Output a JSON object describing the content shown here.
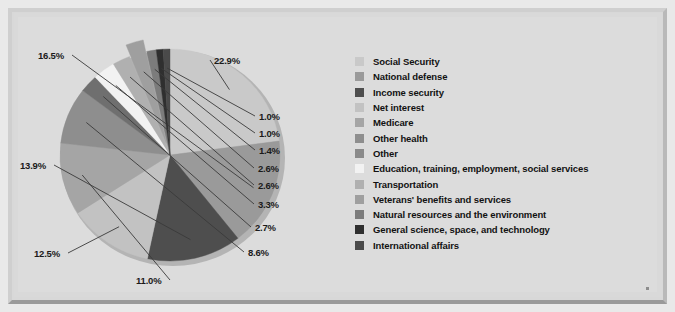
{
  "figure": {
    "background_color": "#dcdcdc",
    "frame_color": "#cfcfcf"
  },
  "chart_data": {
    "type": "pie",
    "title": "",
    "subtitle": "",
    "xlabel": "",
    "ylabel": "",
    "legend_position": "right",
    "grid": false,
    "units": "percent",
    "start_angle_deg": 0,
    "direction": "clockwise",
    "exploded_slices": [
      "Veterans' benefits and services"
    ],
    "categories": [
      "Social Security",
      "National defense",
      "Income security",
      "Net interest",
      "Medicare",
      "Other health",
      "Other",
      "Education, training, employment, social services",
      "Transportation",
      "Veterans' benefits and services",
      "Natural resources and the environment",
      "General science, space, and technology",
      "International affairs"
    ],
    "values": [
      22.9,
      16.5,
      13.9,
      12.5,
      11.0,
      8.6,
      2.7,
      3.3,
      2.6,
      2.6,
      1.4,
      1.0,
      1.0
    ],
    "value_labels": [
      "22.9%",
      "16.5%",
      "13.9%",
      "12.5%",
      "11.0%",
      "8.6%",
      "2.7%",
      "3.3%",
      "2.6%",
      "2.6%",
      "1.4%",
      "1.0%",
      "1.0%"
    ],
    "colors": [
      "#c9c9c9",
      "#9a9a9a",
      "#4e4e4e",
      "#c2c2c2",
      "#a5a5a5",
      "#8e8e8e",
      "#6f6f6f",
      "#f2f2f2",
      "#b0b0b0",
      "#9f9f9f",
      "#7c7c7c",
      "#2f2f2f",
      "#4a4a4a"
    ]
  },
  "legend": {
    "items": [
      {
        "label": "Social Security",
        "color": "#c9c9c9"
      },
      {
        "label": "National defense",
        "color": "#9a9a9a"
      },
      {
        "label": "Income security",
        "color": "#4e4e4e"
      },
      {
        "label": "Net interest",
        "color": "#c2c2c2"
      },
      {
        "label": "Medicare",
        "color": "#a5a5a5"
      },
      {
        "label": "Other health",
        "color": "#8e8e8e"
      },
      {
        "label": "Other",
        "color": "#8a8a8a"
      },
      {
        "label": "Education, training, employment, social services",
        "color": "#f2f2f2"
      },
      {
        "label": "Transportation",
        "color": "#b0b0b0"
      },
      {
        "label": "Veterans' benefits and services",
        "color": "#9f9f9f"
      },
      {
        "label": "Natural resources and the environment",
        "color": "#7c7c7c"
      },
      {
        "label": "General science, space, and technology",
        "color": "#2f2f2f"
      },
      {
        "label": "International affairs",
        "color": "#4a4a4a"
      }
    ]
  },
  "callouts": [
    {
      "text": "22.9%",
      "x": 196,
      "y": 38
    },
    {
      "text": "16.5%",
      "x": 20,
      "y": 33
    },
    {
      "text": "13.9%",
      "x": 2,
      "y": 143
    },
    {
      "text": "12.5%",
      "x": 16,
      "y": 231
    },
    {
      "text": "11.0%",
      "x": 118,
      "y": 258
    },
    {
      "text": "8.6%",
      "x": 230,
      "y": 230
    },
    {
      "text": "2.7%",
      "x": 237,
      "y": 205
    },
    {
      "text": "3.3%",
      "x": 240,
      "y": 182
    },
    {
      "text": "2.6%",
      "x": 240,
      "y": 163
    },
    {
      "text": "2.6%",
      "x": 240,
      "y": 146
    },
    {
      "text": "1.4%",
      "x": 241,
      "y": 128
    },
    {
      "text": "1.0%",
      "x": 241,
      "y": 111
    },
    {
      "text": "1.0%",
      "x": 241,
      "y": 94
    }
  ]
}
